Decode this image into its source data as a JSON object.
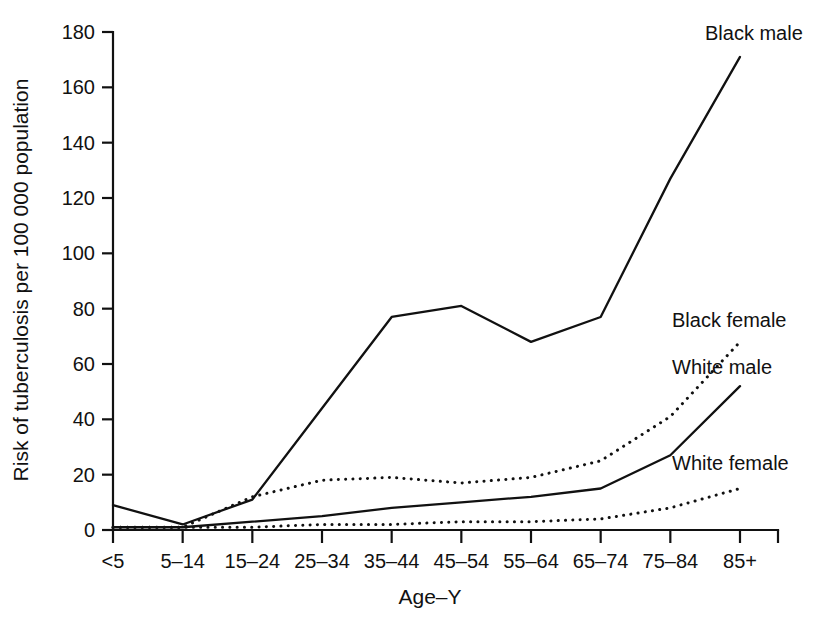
{
  "chart_data": {
    "type": "line",
    "title": "",
    "xlabel": "Age–Y",
    "ylabel": "Risk of tuberculosis per 100 000 population",
    "categories": [
      "<5",
      "5–14",
      "15–24",
      "25–34",
      "35–44",
      "45–54",
      "55–64",
      "65–74",
      "75–84",
      "85+"
    ],
    "ylim": [
      0,
      180
    ],
    "yticks": [
      0,
      20,
      40,
      60,
      80,
      100,
      120,
      140,
      160,
      180
    ],
    "ytick_labels": [
      "0",
      "20",
      "40",
      "60",
      "80",
      "100",
      "120",
      "140",
      "160",
      "180"
    ],
    "grid": false,
    "legend_position": "inline-right-labels",
    "series": [
      {
        "name": "Black male",
        "style": "solid",
        "color": "#111111",
        "label": "Black male",
        "values": [
          9,
          2,
          11,
          44,
          77,
          81,
          68,
          77,
          127,
          171
        ]
      },
      {
        "name": "Black female",
        "style": "dotted",
        "color": "#111111",
        "label": "Black female",
        "values": [
          1,
          1,
          12,
          18,
          19,
          17,
          19,
          25,
          41,
          68
        ]
      },
      {
        "name": "White male",
        "style": "solid",
        "color": "#111111",
        "label": "White male",
        "values": [
          1,
          1,
          3,
          5,
          8,
          10,
          12,
          15,
          27,
          52
        ]
      },
      {
        "name": "White female",
        "style": "dotted",
        "color": "#111111",
        "label": "White female",
        "values": [
          1,
          1,
          1,
          2,
          2,
          3,
          3,
          4,
          8,
          15
        ]
      }
    ],
    "annotations": [
      {
        "text": "Black male",
        "series": "Black male",
        "x_px": 705,
        "y_px": 40
      },
      {
        "text": "Black female",
        "series": "Black female",
        "x_px": 672,
        "y_px": 327
      },
      {
        "text": "White male",
        "series": "White male",
        "x_px": 672,
        "y_px": 374
      },
      {
        "text": "White female",
        "series": "White female",
        "x_px": 672,
        "y_px": 470
      }
    ]
  }
}
